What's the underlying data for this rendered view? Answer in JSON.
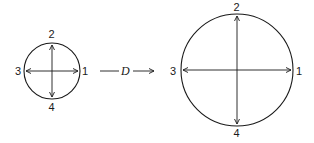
{
  "diagram": {
    "small_circle": {
      "labels": {
        "right": "1",
        "top": "2",
        "left": "3",
        "bottom": "4"
      }
    },
    "transform": {
      "label": "D"
    },
    "large_circle": {
      "labels": {
        "right": "1",
        "top": "2",
        "left": "3",
        "bottom": "4"
      }
    },
    "colors": {
      "stroke": "#1a1a1a",
      "background": "#ffffff"
    }
  }
}
